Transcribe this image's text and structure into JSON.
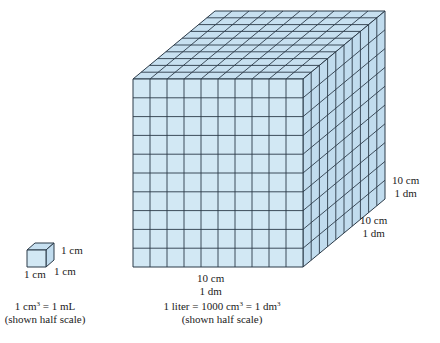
{
  "colors": {
    "front_face": "#d2e8f4",
    "side_face": "#c1dcee",
    "top_face": "#c7e0f0",
    "grid_line": "#2b3a48",
    "text": "#222222"
  },
  "large_cube": {
    "divisions": 10,
    "front": {
      "x": 133,
      "y": 79,
      "w": 170,
      "h": 188
    },
    "depth_offset": {
      "dx": 82,
      "dy": -68
    },
    "labels": {
      "height_cm": "10 cm",
      "height_dm": "1 dm",
      "depth_cm": "10 cm",
      "depth_dm": "1 dm",
      "width_cm": "10 cm",
      "width_dm": "1 dm"
    },
    "caption": {
      "line1_pre": "1 liter = 1000 cm",
      "line1_sup1": "3",
      "line1_mid": " = 1 dm",
      "line1_sup2": "3",
      "line2": "(shown half scale)"
    }
  },
  "small_cube": {
    "front": {
      "x": 27,
      "y": 250,
      "w": 19,
      "h": 17
    },
    "depth_offset": {
      "dx": 8,
      "dy": -7
    },
    "labels": {
      "height": "1 cm",
      "depth": "1 cm",
      "width": "1 cm"
    },
    "caption": {
      "line1_pre": "1 cm",
      "line1_sup": "3",
      "line1_post": " = 1 mL",
      "line2": "(shown half scale)"
    }
  }
}
